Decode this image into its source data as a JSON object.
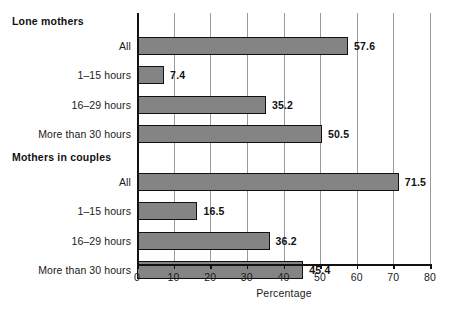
{
  "chart_data": {
    "type": "bar",
    "orientation": "horizontal",
    "title": "",
    "xlabel": "Percentage",
    "ylabel": "",
    "xlim": [
      0,
      80
    ],
    "xticks": [
      0,
      10,
      20,
      30,
      40,
      50,
      60,
      70,
      80
    ],
    "xticklabels": [
      "0",
      "10",
      "20",
      "30",
      "40",
      "50",
      "60",
      "70",
      "80"
    ],
    "grid": "vertical",
    "legend": "none",
    "bar_color": "#848484",
    "bar_edge_color": "#111111",
    "groups": [
      {
        "header": "Lone mothers",
        "categories": [
          "All",
          "1–15 hours",
          "16–29 hours",
          "More than 30 hours"
        ],
        "values": [
          57.6,
          7.4,
          35.2,
          50.5
        ],
        "value_labels": [
          "57.6",
          "7.4",
          "35.2",
          "50.5"
        ]
      },
      {
        "header": "Mothers in couples",
        "categories": [
          "All",
          "1–15 hours",
          "16–29 hours",
          "More than 30 hours"
        ],
        "values": [
          71.5,
          16.5,
          36.2,
          45.4
        ],
        "value_labels": [
          "71.5",
          "16.5",
          "36.2",
          "45.4"
        ]
      }
    ]
  }
}
